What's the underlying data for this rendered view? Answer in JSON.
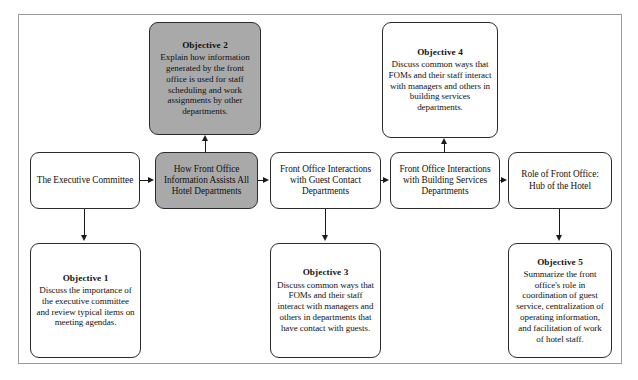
{
  "diagram": {
    "type": "flowchart",
    "title_visible": false,
    "palette": {
      "shaded_fill": "#a9a9a9",
      "plain_fill": "#ffffff",
      "border": "#2b2b2b",
      "frame": "#9a9a9a",
      "arrow": "#1a1a1a",
      "text": "#111111"
    },
    "nodes": [
      {
        "id": "objective-2",
        "row": "top",
        "shaded": true,
        "heading": "Objective 2",
        "body": "Explain how information generated by the front office is used for staff scheduling and work assignments by other departments."
      },
      {
        "id": "objective-4",
        "row": "top",
        "shaded": false,
        "heading": "Objective 4",
        "body": "Discuss common ways that FOMs and their staff interact with managers and others in building services departments."
      },
      {
        "id": "executive-committee",
        "row": "middle",
        "shaded": false,
        "heading": "",
        "body": "The Executive Committee"
      },
      {
        "id": "front-office-information",
        "row": "middle",
        "shaded": true,
        "heading": "",
        "body": "How Front Office Information Assists All Hotel Departments"
      },
      {
        "id": "guest-contact-interactions",
        "row": "middle",
        "shaded": false,
        "heading": "",
        "body": "Front Office Interactions with Guest Contact Departments"
      },
      {
        "id": "building-services-interactions",
        "row": "middle",
        "shaded": false,
        "heading": "",
        "body": "Front Office Interactions with Building Services Departments"
      },
      {
        "id": "role-of-front-office",
        "row": "middle",
        "shaded": false,
        "heading": "",
        "body": "Role of Front Office: Hub of the Hotel"
      },
      {
        "id": "objective-1",
        "row": "bottom",
        "shaded": false,
        "heading": "Objective 1",
        "body": "Discuss the importance of the executive committee and review typical items on meeting agendas."
      },
      {
        "id": "objective-3",
        "row": "bottom",
        "shaded": false,
        "heading": "Objective 3",
        "body": "Discuss common ways that FOMs and their staff interact with managers and others in departments that have contact with guests."
      },
      {
        "id": "objective-5",
        "row": "bottom",
        "shaded": false,
        "heading": "Objective 5",
        "body": "Summarize the front office's role in coordination of guest service, centralization of operating information, and facilitation of work of hotel staff."
      }
    ],
    "edges": [
      {
        "id": "edge-exec-to-info",
        "from": "executive-committee",
        "to": "front-office-information",
        "direction": "right"
      },
      {
        "id": "edge-info-to-guest",
        "from": "front-office-information",
        "to": "guest-contact-interactions",
        "direction": "right"
      },
      {
        "id": "edge-guest-to-building",
        "from": "guest-contact-interactions",
        "to": "building-services-interactions",
        "direction": "right"
      },
      {
        "id": "edge-building-to-role",
        "from": "building-services-interactions",
        "to": "role-of-front-office",
        "direction": "right"
      },
      {
        "id": "edge-info-to-obj2",
        "from": "front-office-information",
        "to": "objective-2",
        "direction": "up"
      },
      {
        "id": "edge-building-to-obj4",
        "from": "building-services-interactions",
        "to": "objective-4",
        "direction": "up"
      },
      {
        "id": "edge-exec-to-obj1",
        "from": "executive-committee",
        "to": "objective-1",
        "direction": "down"
      },
      {
        "id": "edge-guest-to-obj3",
        "from": "guest-contact-interactions",
        "to": "objective-3",
        "direction": "down"
      },
      {
        "id": "edge-role-to-obj5",
        "from": "role-of-front-office",
        "to": "objective-5",
        "direction": "down"
      }
    ]
  }
}
